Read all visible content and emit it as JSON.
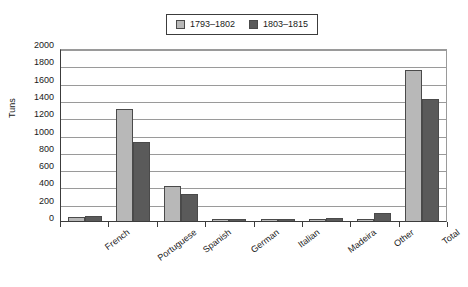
{
  "chart_data": {
    "type": "bar",
    "title": "",
    "subtitle": "",
    "xlabel": "",
    "ylabel": "Tuns",
    "ylim": [
      0,
      2000
    ],
    "ytick_step": 200,
    "yticks": [
      2000,
      1800,
      1600,
      1400,
      1200,
      1000,
      800,
      600,
      400,
      200,
      0
    ],
    "grid": true,
    "legend_position": "top-center",
    "categories": [
      "French",
      "Portuguese",
      "Spanish",
      "German",
      "Italian",
      "Madeira",
      "Other",
      "Total"
    ],
    "series": [
      {
        "name": "1793–1802",
        "color": "#b8b8b8",
        "values": [
          45,
          1295,
          400,
          10,
          12,
          15,
          15,
          1750
        ]
      },
      {
        "name": "1803–1815",
        "color": "#5a5a5a",
        "values": [
          60,
          915,
          310,
          12,
          25,
          35,
          90,
          1410
        ]
      }
    ]
  },
  "colors": {
    "series_light": "#b8b8b8",
    "series_dark": "#5a5a5a",
    "axis": "#3c3c3c",
    "gridline": "#9a9a9a",
    "background": "#ffffff"
  }
}
